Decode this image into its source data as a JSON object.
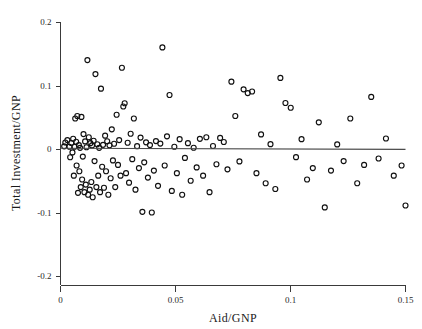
{
  "chart_data": {
    "type": "scatter",
    "title": "",
    "xlabel": "Aid/GNP",
    "ylabel": "Total Investment/GNP",
    "xlim": [
      0,
      0.15
    ],
    "ylim": [
      -0.2,
      0.2
    ],
    "xticks": [
      0,
      0.05,
      0.1,
      0.15
    ],
    "xticklabels": [
      "0",
      "0.05",
      "0.1",
      "0.15"
    ],
    "yticks": [
      0.2,
      0.1,
      0,
      -0.1,
      -0.2
    ],
    "yticklabels": [
      "0.2",
      "0.1",
      "0",
      "-0.1",
      "-0.2"
    ],
    "grid": false,
    "legend": null,
    "marker": "open-circle",
    "series": [
      {
        "name": "countries",
        "x": [
          0.0016,
          0.0021,
          0.003,
          0.0039,
          0.0042,
          0.0047,
          0.0052,
          0.0055,
          0.0058,
          0.0061,
          0.0064,
          0.0068,
          0.007,
          0.0073,
          0.0076,
          0.008,
          0.0082,
          0.0085,
          0.0088,
          0.0091,
          0.0094,
          0.0097,
          0.01,
          0.0104,
          0.0107,
          0.011,
          0.0113,
          0.0117,
          0.012,
          0.0123,
          0.0127,
          0.013,
          0.0134,
          0.0137,
          0.014,
          0.0144,
          0.0148,
          0.0152,
          0.0156,
          0.016,
          0.0164,
          0.0168,
          0.0172,
          0.0176,
          0.0181,
          0.0185,
          0.0189,
          0.0194,
          0.0198,
          0.0203,
          0.0208,
          0.0213,
          0.0218,
          0.0223,
          0.0228,
          0.0233,
          0.0238,
          0.0244,
          0.025,
          0.0255,
          0.0261,
          0.0267,
          0.0273,
          0.0279,
          0.0285,
          0.0292,
          0.0298,
          0.0305,
          0.0312,
          0.0319,
          0.0326,
          0.0333,
          0.0341,
          0.0348,
          0.0356,
          0.0364,
          0.0372,
          0.038,
          0.0389,
          0.0397,
          0.0406,
          0.0415,
          0.0424,
          0.0434,
          0.0443,
          0.0453,
          0.0463,
          0.0474,
          0.0484,
          0.0495,
          0.0506,
          0.0518,
          0.0529,
          0.0541,
          0.0554,
          0.0566,
          0.0579,
          0.0592,
          0.0606,
          0.062,
          0.0634,
          0.0648,
          0.0663,
          0.0678,
          0.0694,
          0.071,
          0.0726,
          0.0743,
          0.076,
          0.0778,
          0.0796,
          0.0814,
          0.0833,
          0.0852,
          0.0872,
          0.0892,
          0.0913,
          0.0934,
          0.0956,
          0.0978,
          0.1001,
          0.1024,
          0.1048,
          0.1072,
          0.1097,
          0.1123,
          0.1149,
          0.1176,
          0.1203,
          0.1231,
          0.126,
          0.129,
          0.132,
          0.1351,
          0.1383,
          0.1415,
          0.1449,
          0.1483,
          0.15
        ],
        "y": [
          0.0042,
          0.0102,
          0.014,
          0.0035,
          -0.013,
          0.0095,
          -0.0054,
          0.0162,
          -0.042,
          0.0035,
          0.048,
          0.0115,
          -0.026,
          0.052,
          -0.069,
          0.006,
          -0.035,
          0.0018,
          -0.06,
          0.0505,
          -0.048,
          -0.012,
          0.0235,
          -0.068,
          0.012,
          -0.056,
          0.0028,
          0.14,
          -0.072,
          0.0185,
          -0.064,
          0.0092,
          -0.052,
          0.0056,
          -0.076,
          0.013,
          -0.019,
          0.118,
          -0.06,
          0.0075,
          -0.042,
          0.0018,
          -0.068,
          0.095,
          -0.028,
          0.0065,
          -0.061,
          0.021,
          -0.035,
          0.0122,
          -0.072,
          0.0058,
          -0.046,
          0.031,
          -0.018,
          0.0082,
          -0.06,
          0.054,
          -0.025,
          0.014,
          -0.042,
          0.128,
          0.067,
          0.072,
          -0.038,
          0.0098,
          -0.053,
          0.024,
          -0.016,
          0.048,
          -0.064,
          0.0045,
          -0.03,
          0.018,
          -0.099,
          -0.021,
          0.0105,
          -0.045,
          0.0062,
          -0.1,
          -0.034,
          0.0125,
          -0.058,
          0.0085,
          0.16,
          -0.026,
          0.02,
          0.085,
          -0.066,
          0.0035,
          -0.038,
          0.0155,
          -0.072,
          -0.014,
          0.0092,
          -0.05,
          0.002,
          -0.029,
          0.016,
          -0.042,
          0.0185,
          -0.068,
          0.0048,
          -0.024,
          0.0175,
          0.011,
          -0.032,
          0.106,
          0.052,
          -0.0195,
          0.094,
          0.088,
          0.0905,
          -0.038,
          0.023,
          -0.054,
          0.0076,
          -0.063,
          0.112,
          0.0725,
          0.065,
          -0.0128,
          0.0155,
          -0.048,
          -0.03,
          0.042,
          -0.092,
          -0.034,
          0.0072,
          -0.019,
          0.048,
          -0.054,
          -0.025,
          0.082,
          -0.015,
          0.0165,
          -0.042,
          -0.026,
          -0.089
        ]
      }
    ],
    "fit_line": {
      "name": "regression-line",
      "x": [
        0,
        0.15
      ],
      "y": [
        0.0012,
        -0.0006
      ],
      "style": "solid"
    }
  }
}
